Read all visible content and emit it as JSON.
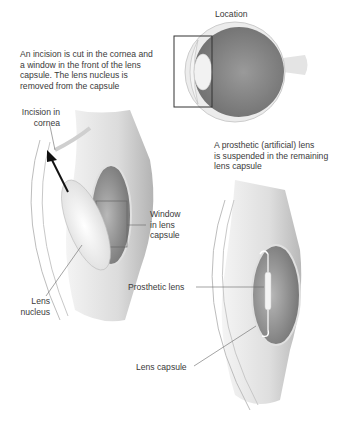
{
  "diagram": {
    "title_location": "Location",
    "step1_caption": "An incision is cut in the cornea and\na window in the front of the lens\ncapsule. The lens nucleus is\nremoved from the capsule",
    "step2_caption": "A prosthetic (artificial) lens\nis suspended in the remaining\nlens capsule",
    "labels": {
      "incision": "Incision in\ncornea",
      "window": "Window\nin lens\ncapsule",
      "nucleus": "Lens\nnucleus",
      "prosthetic": "Prosthetic lens",
      "capsule": "Lens capsule"
    },
    "colors": {
      "background": "#ffffff",
      "eye_interior": "#8c8c8c",
      "sclera": "#e6e6e6",
      "tissue": "#d4d4d4",
      "lens": "#f2f2f2",
      "text": "#3a3a3a",
      "leader": "#555555"
    }
  }
}
